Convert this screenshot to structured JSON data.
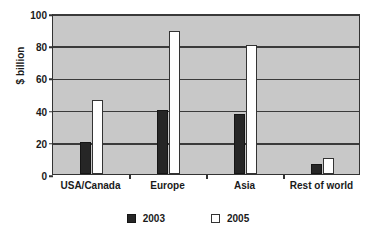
{
  "chart_data": {
    "type": "bar",
    "title": "",
    "subtitle": "",
    "xlabel": "",
    "ylabel": "$ billion",
    "categories": [
      "USA/Canada",
      "Europe",
      "Asia",
      "Rest of world"
    ],
    "series": [
      {
        "name": "2003",
        "values": [
          20,
          40,
          37,
          6
        ],
        "color": "#262626"
      },
      {
        "name": "2005",
        "values": [
          46,
          89,
          80,
          10
        ],
        "color": "#ffffff"
      }
    ],
    "ylim": [
      0,
      100
    ],
    "ytick_labels": [
      "0",
      "20",
      "40",
      "60",
      "80",
      "100"
    ],
    "ytick_values": [
      0,
      20,
      40,
      60,
      80,
      100
    ],
    "grid": true,
    "grid_axis": "y",
    "legend_position": "bottom-center",
    "plot_background_color": "#c8c8c8",
    "page_background_color": "#ffffff",
    "axis_color": "#333333"
  },
  "legend": {
    "entries": [
      {
        "label": "2003",
        "marker": "filled-square-dark"
      },
      {
        "label": "2005",
        "marker": "open-square-white"
      }
    ]
  }
}
